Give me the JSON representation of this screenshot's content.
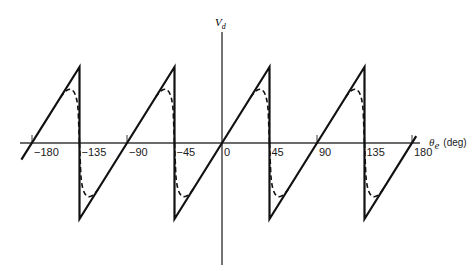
{
  "chart_data": {
    "type": "line",
    "title": "",
    "xlabel": "θe (deg)",
    "xlabel_symbol": "θ",
    "xlabel_sub": "e",
    "xlabel_unit": "(deg)",
    "ylabel": "Vd",
    "ylabel_symbol": "V",
    "ylabel_sub": "d",
    "xlim": [
      -190,
      184
    ],
    "ylim": [
      -1,
      1
    ],
    "x_ticks": [
      -180,
      -135,
      -90,
      -45,
      0,
      45,
      90,
      135,
      180
    ],
    "x_tick_labels": [
      "−180",
      "−135",
      "−90",
      "−45",
      "0",
      "45",
      "90",
      "135",
      "180"
    ],
    "grid": false,
    "legend": null,
    "series": [
      {
        "name": "ideal sawtooth (solid)",
        "style": "solid",
        "x": [
          -190,
          -135,
          -135,
          -45,
          -45,
          45,
          45,
          135,
          135,
          184
        ],
        "y": [
          -0.22,
          1,
          -1,
          1,
          -1,
          1,
          -1,
          1,
          -1,
          0.09
        ]
      },
      {
        "name": "actual characteristic (dashed)",
        "style": "dashed",
        "description": "follows solid line, rounds over before each discontinuity peaking at about ±0.72, crosses zero at the jump",
        "peak_value": 0.72,
        "peak_offset_deg": -10,
        "depart_offset_deg": -18
      }
    ]
  },
  "labels": {
    "y_axis_symbol": "V",
    "y_axis_sub": "d",
    "x_axis_symbol": "θ",
    "x_axis_sub": "e",
    "x_axis_unit": "(deg)"
  }
}
